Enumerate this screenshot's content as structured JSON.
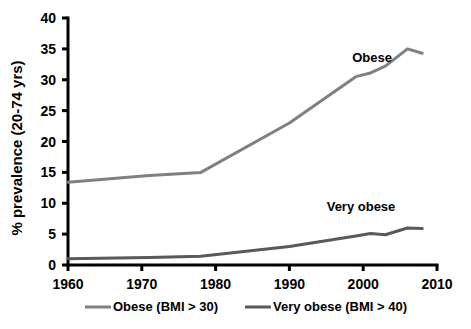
{
  "chart_data": {
    "type": "line",
    "title": "",
    "xlabel": "",
    "ylabel": "% prevalence (20-74 yrs)",
    "xlim": [
      1960,
      2010
    ],
    "ylim": [
      0,
      40
    ],
    "xticks": [
      1960,
      1970,
      1980,
      1990,
      2000,
      2010
    ],
    "yticks": [
      0,
      5,
      10,
      15,
      20,
      25,
      30,
      35,
      40
    ],
    "grid": false,
    "legend_position": "bottom",
    "series": [
      {
        "name": "Obese (BMI > 30)",
        "annotation": "Obese",
        "color": "#808080",
        "x": [
          1960,
          1971,
          1978,
          1990,
          1999,
          2001,
          2003,
          2006,
          2008
        ],
        "values": [
          13.4,
          14.5,
          15.0,
          23.0,
          30.5,
          31.1,
          32.2,
          35.0,
          34.3
        ]
      },
      {
        "name": "Very obese (BMI > 40)",
        "annotation": "Very obese",
        "color": "#595959",
        "x": [
          1960,
          1971,
          1978,
          1990,
          1999,
          2001,
          2003,
          2006,
          2008
        ],
        "values": [
          1.0,
          1.2,
          1.4,
          3.0,
          4.7,
          5.1,
          4.9,
          6.0,
          5.9
        ]
      }
    ]
  },
  "annotations": {
    "obese": "Obese",
    "very_obese": "Very obese"
  },
  "legend": {
    "items": [
      {
        "label": "Obese (BMI > 30)",
        "color": "#808080"
      },
      {
        "label": "Very obese (BMI > 40)",
        "color": "#595959"
      }
    ]
  },
  "axis": {
    "y_title": "% prevalence (20-74 yrs)",
    "y_tick_labels": [
      "40",
      "35",
      "30",
      "25",
      "20",
      "15",
      "10",
      "5",
      "0"
    ],
    "x_tick_labels": [
      "1960",
      "1970",
      "1980",
      "1990",
      "2000",
      "2010"
    ]
  }
}
